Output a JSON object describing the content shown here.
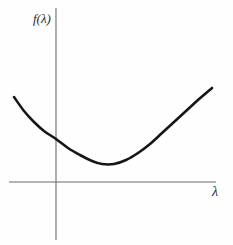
{
  "figure": {
    "background_color": "#fefefe",
    "axis_color": "#6b6b6b",
    "curve_color": "#161616",
    "label_color": "#2b2b2b"
  },
  "labels": {
    "y_axis": "f(λ)",
    "x_axis": "λ"
  },
  "chart_data": {
    "type": "line",
    "title": "",
    "xlabel": "λ",
    "ylabel": "f(λ)",
    "grid": false,
    "legend": null,
    "annotations": [],
    "axes": {
      "origin_px": [
        56,
        182
      ],
      "x_axis_px": {
        "x_start": 9,
        "x_end": 216,
        "y": 182
      },
      "y_axis_px": {
        "y_start": 8,
        "y_end": 240,
        "x": 56
      },
      "x_tick_labels": [],
      "y_tick_labels": [],
      "xlim": [
        -1.05,
        4.0
      ],
      "ylim": [
        -1.15,
        4.25
      ]
    },
    "series": [
      {
        "name": "f(λ)",
        "description": "convex upward-opening curve with a single interior minimum above the horizontal axis",
        "color": "#161616",
        "stroke_width_px": 2.6,
        "points_px": [
          [
            14,
            97
          ],
          [
            24,
            111
          ],
          [
            34,
            122
          ],
          [
            44,
            131
          ],
          [
            56,
            139
          ],
          [
            68,
            148
          ],
          [
            80,
            155
          ],
          [
            92,
            161
          ],
          [
            102,
            164
          ],
          [
            114,
            164
          ],
          [
            126,
            160
          ],
          [
            138,
            153
          ],
          [
            150,
            144
          ],
          [
            162,
            133
          ],
          [
            174,
            122
          ],
          [
            186,
            111
          ],
          [
            198,
            100
          ],
          [
            212,
            88
          ]
        ],
        "minimum_px": [
          107,
          164
        ],
        "y_intercept_px": [
          56,
          139
        ],
        "x_data": [
          -1.0,
          -0.76,
          -0.52,
          -0.28,
          0.0,
          0.29,
          0.57,
          0.86,
          1.1,
          1.39,
          1.67,
          1.96,
          2.25,
          2.53,
          2.82,
          3.1,
          3.39,
          3.72
        ],
        "y_data": [
          2.12,
          1.79,
          1.53,
          1.32,
          1.13,
          0.92,
          0.76,
          0.62,
          0.55,
          0.55,
          0.64,
          0.81,
          1.02,
          1.27,
          1.53,
          1.79,
          2.05,
          2.33
        ]
      }
    ]
  }
}
